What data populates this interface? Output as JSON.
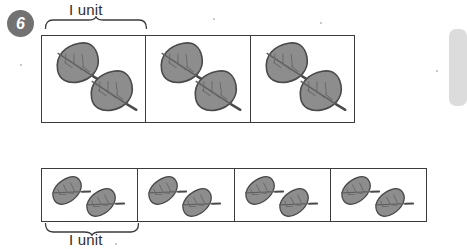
{
  "page": {
    "question_number": "6",
    "background_color": "#ffffff"
  },
  "colors": {
    "badge_fill": "#727272",
    "badge_text": "#ffffff",
    "box_border": "#3b3b3b",
    "leaf_fill": "#8d8d8d",
    "leaf_outline": "#4a4a4a",
    "leaf_vein": "#6a6a6a",
    "label_text": "#2f2f2f",
    "right_tab": "#dcdcdc"
  },
  "top_group": {
    "unit_label": "I unit",
    "brace_position": "above",
    "cells": [
      {
        "leaf_count": 2,
        "leaf_size": "large"
      },
      {
        "leaf_count": 2,
        "leaf_size": "large"
      },
      {
        "leaf_count": 2,
        "leaf_size": "large"
      }
    ],
    "total_leaves": 6,
    "cell_count": 3
  },
  "bottom_group": {
    "unit_label": "I unit",
    "brace_position": "below",
    "cells": [
      {
        "leaf_count": 2,
        "leaf_size": "small"
      },
      {
        "leaf_count": 2,
        "leaf_size": "small"
      },
      {
        "leaf_count": 2,
        "leaf_size": "small"
      },
      {
        "leaf_count": 2,
        "leaf_size": "small"
      }
    ],
    "total_leaves": 8,
    "cell_count": 4
  },
  "icons": {
    "leaf": "leaf-icon",
    "brace": "curly-brace-icon"
  },
  "right_tab": {
    "name": "page-edge-tab"
  }
}
